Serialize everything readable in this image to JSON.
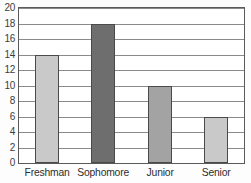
{
  "chart_data": {
    "type": "bar",
    "title": "",
    "subtitle": "",
    "xlabel": "",
    "ylabel": "",
    "categories": [
      "Freshman",
      "Sophomore",
      "Junior",
      "Senior"
    ],
    "values": [
      14,
      18,
      10,
      6
    ],
    "ylim": [
      0,
      20
    ],
    "ytick_values": [
      0,
      2,
      4,
      6,
      8,
      10,
      12,
      14,
      16,
      18,
      20
    ],
    "ytick_labels": [
      "0",
      "2",
      "4",
      "6",
      "8",
      "10",
      "12",
      "14",
      "16",
      "18",
      "20"
    ],
    "grid": true,
    "grid_axis": "y",
    "legend": false,
    "legend_position": "none",
    "bar_colors": [
      "#c9c9c9",
      "#6e6e6e",
      "#a3a3a3",
      "#c9c9c9"
    ],
    "bar_edge_color": "#4a4a4a",
    "gridline_color": "#8a8a8a",
    "frame_color": "#5a5a5a",
    "plot_background": "#ffffff",
    "annotations": []
  }
}
